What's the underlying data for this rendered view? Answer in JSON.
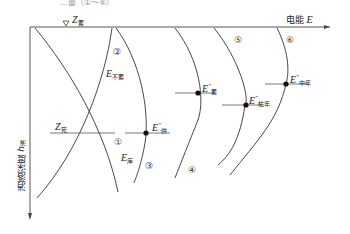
{
  "caption": "…量（①～⑥）",
  "axes": {
    "x_label": "电能",
    "x_symbol": "E",
    "y_label": "消落深度",
    "y_symbol": "h",
    "y_sub": "消"
  },
  "level_marker": {
    "symbol": "Z",
    "sub": "蓄"
  },
  "dead_level": {
    "symbol": "Z",
    "sub": "死"
  },
  "curve_numbers": [
    "①",
    "②",
    "③",
    "④",
    "⑤",
    "⑥"
  ],
  "curve_labels": {
    "e_not_store": {
      "symbol": "E",
      "sub": "不蓄"
    },
    "e_store": {
      "symbol": "E",
      "sub": "库"
    }
  },
  "points": [
    {
      "symbol": "E",
      "prime": "″",
      "sub": "供"
    },
    {
      "symbol": "E",
      "prime": "″",
      "sub": "蓄"
    },
    {
      "symbol": "E",
      "prime": "″",
      "sub": "枯年"
    },
    {
      "symbol": "E",
      "prime": "″",
      "sub": "中年"
    }
  ]
}
